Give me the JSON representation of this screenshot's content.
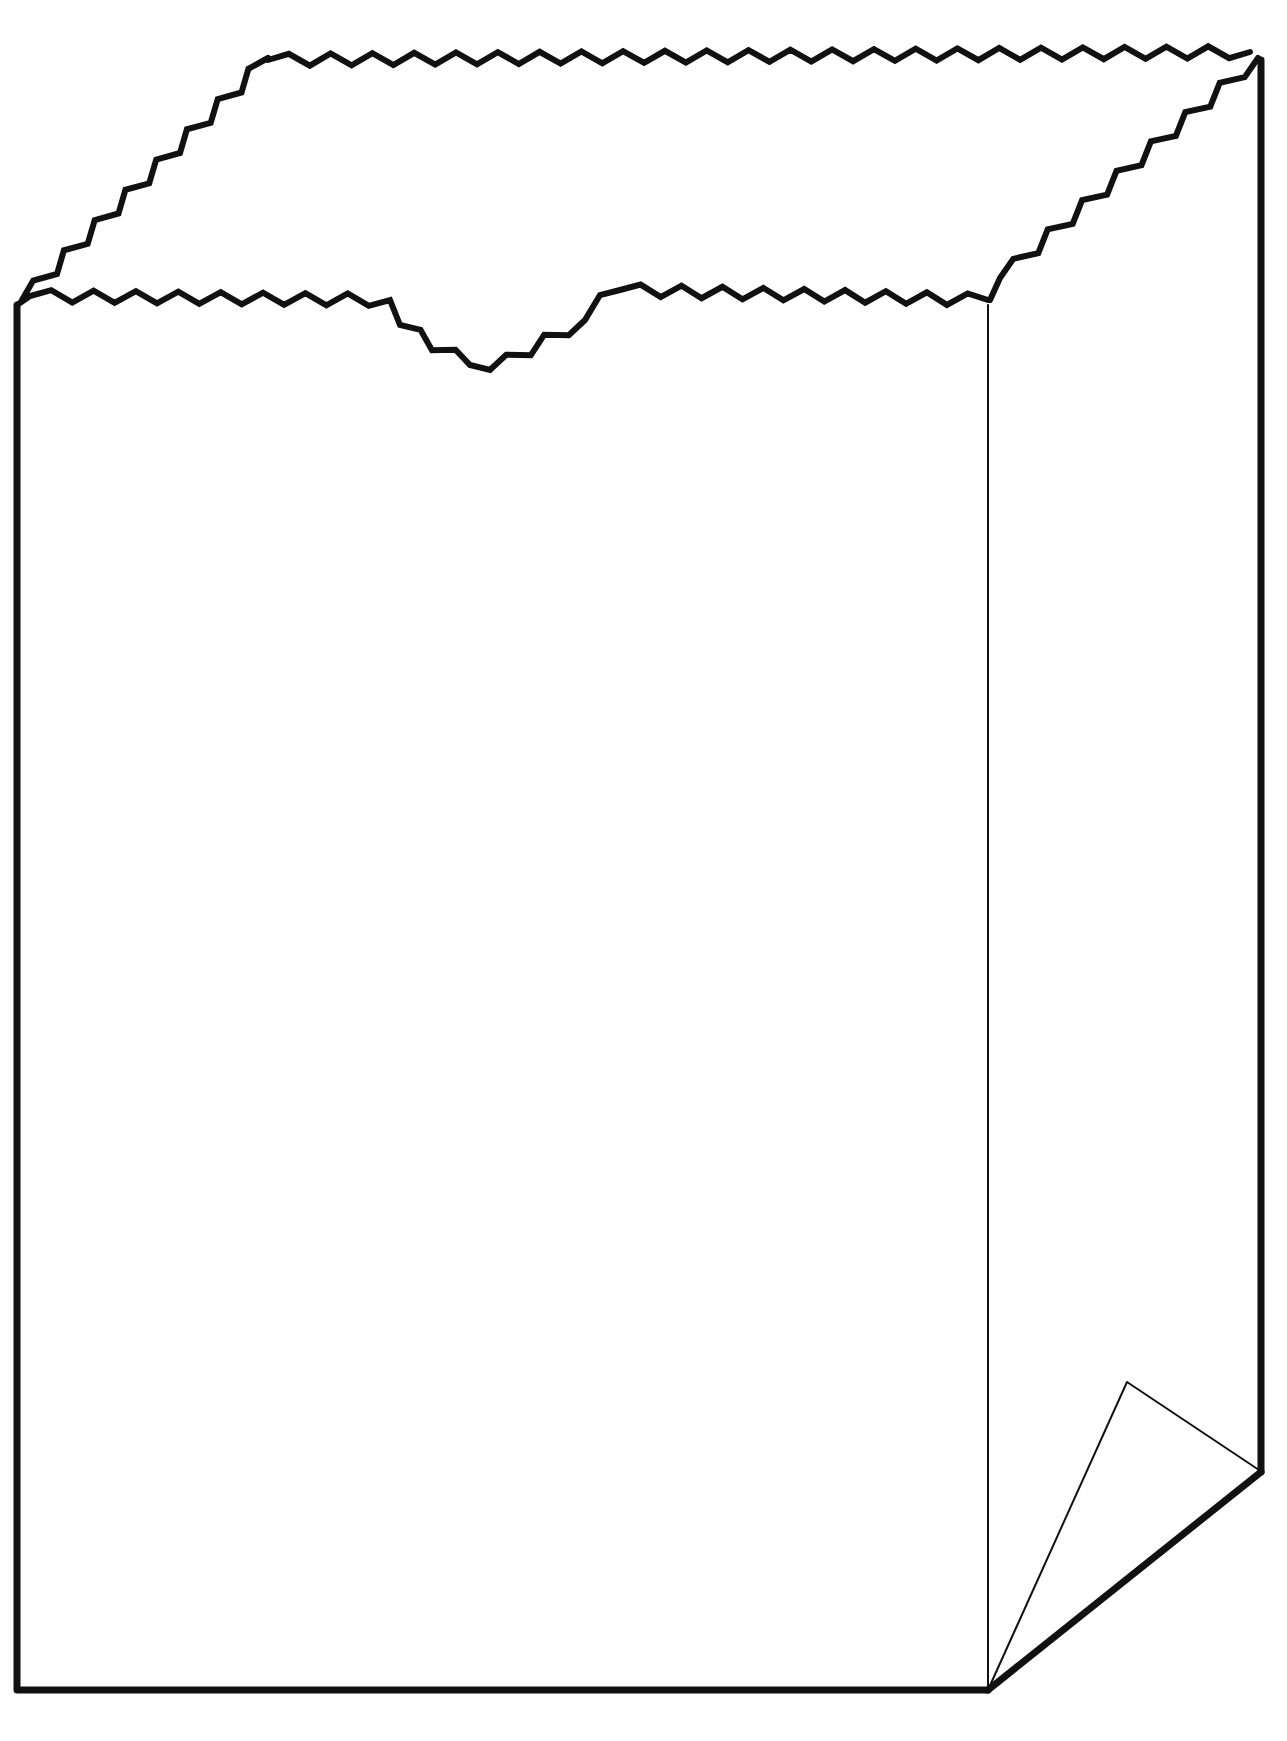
{
  "illustration": {
    "subject": "paper bag",
    "style": "black line art on white",
    "parts": [
      "front-panel",
      "side-panel",
      "open-top-zigzag-edge",
      "back-top-zigzag-edge",
      "thumb-notch",
      "folded-bottom-corner"
    ]
  },
  "colors": {
    "background": "#ffffff",
    "line": "#111111"
  }
}
